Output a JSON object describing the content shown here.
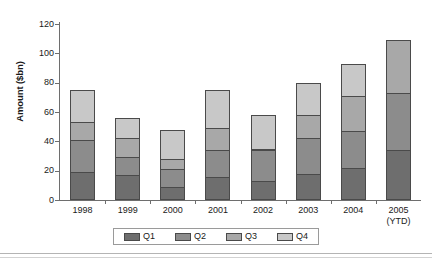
{
  "chart_data": {
    "type": "bar",
    "stacked": true,
    "title": "",
    "xlabel": "",
    "ylabel": "Amount ($bn)",
    "categories": [
      "1998",
      "1999",
      "2000",
      "2001",
      "2002",
      "2003",
      "2004",
      "2005"
    ],
    "category_sublabels": [
      "",
      "",
      "",
      "",
      "",
      "",
      "",
      "(YTD)"
    ],
    "ylim": [
      0,
      120
    ],
    "yticks": [
      0,
      20,
      40,
      60,
      80,
      100,
      120
    ],
    "grid": false,
    "legend_position": "bottom",
    "series": [
      {
        "name": "Q1",
        "color": "#6e6e6e",
        "values": [
          19,
          17,
          9,
          16,
          13,
          18,
          22,
          34
        ]
      },
      {
        "name": "Q2",
        "color": "#8c8c8c",
        "values": [
          22,
          12,
          12,
          18,
          21,
          24,
          25,
          39
        ]
      },
      {
        "name": "Q3",
        "color": "#a8a8a8",
        "values": [
          12,
          13,
          7,
          15,
          1,
          16,
          24,
          36
        ]
      },
      {
        "name": "Q4",
        "color": "#c8c8c8",
        "values": [
          22,
          14,
          20,
          26,
          23,
          22,
          22,
          0
        ]
      }
    ],
    "totals": [
      75,
      56,
      48,
      75,
      58,
      80,
      93,
      109
    ]
  }
}
